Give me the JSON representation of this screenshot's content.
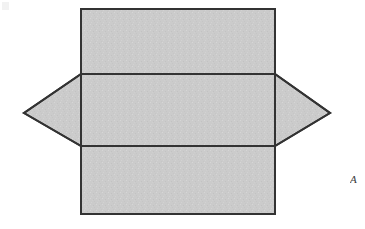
{
  "figure": {
    "title": "Rectangle overlapping hexagon net diagram",
    "background_color": "#ffffff",
    "fill_color": "#cbcbcb",
    "stroke_color": "#333333",
    "stroke_width": 2,
    "canvas": {
      "width": 365,
      "height": 229
    },
    "shapes": [
      {
        "name": "hexagon",
        "type": "polygon",
        "label": "Elongated hexagon (horizontal)",
        "points": "24,113 81,74 275,74 330,113 275,146 81,146",
        "fill": "#cbcbcb",
        "stroke": "#333333"
      },
      {
        "name": "rectangle",
        "type": "rect",
        "label": "Upright rectangle",
        "x": 81,
        "y": 9,
        "width": 194,
        "height": 205,
        "fill": "#cbcbcb",
        "stroke": "#333333"
      }
    ],
    "interior_lines": [
      {
        "name": "upper-crease-line",
        "x1": 81,
        "y1": 74,
        "x2": 275,
        "y2": 74
      },
      {
        "name": "lower-crease-line",
        "x1": 81,
        "y1": 146,
        "x2": 275,
        "y2": 146
      }
    ],
    "artifacts": {
      "top_left_smudge": "",
      "right_edge_glyph": "A"
    }
  }
}
